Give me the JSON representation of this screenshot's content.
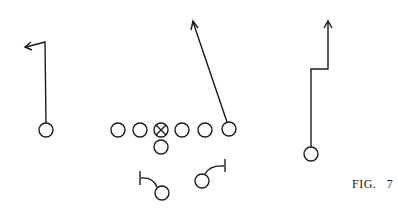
{
  "figure": {
    "label": "FIG.   7",
    "stroke_color": "#1a1a1a",
    "background": "#ffffff"
  },
  "players": {
    "left_receiver": {
      "x": 46,
      "y": 130
    },
    "line": [
      {
        "x": 118,
        "y": 130
      },
      {
        "x": 140,
        "y": 130
      },
      {
        "x": 161,
        "y": 130,
        "center": true
      },
      {
        "x": 182,
        "y": 130
      },
      {
        "x": 205,
        "y": 130
      },
      {
        "x": 229,
        "y": 129
      }
    ],
    "quarterback": {
      "x": 161,
      "y": 147
    },
    "left_back": {
      "x": 162,
      "y": 193
    },
    "right_back": {
      "x": 202,
      "y": 181
    },
    "right_receiver": {
      "x": 311,
      "y": 154
    }
  }
}
